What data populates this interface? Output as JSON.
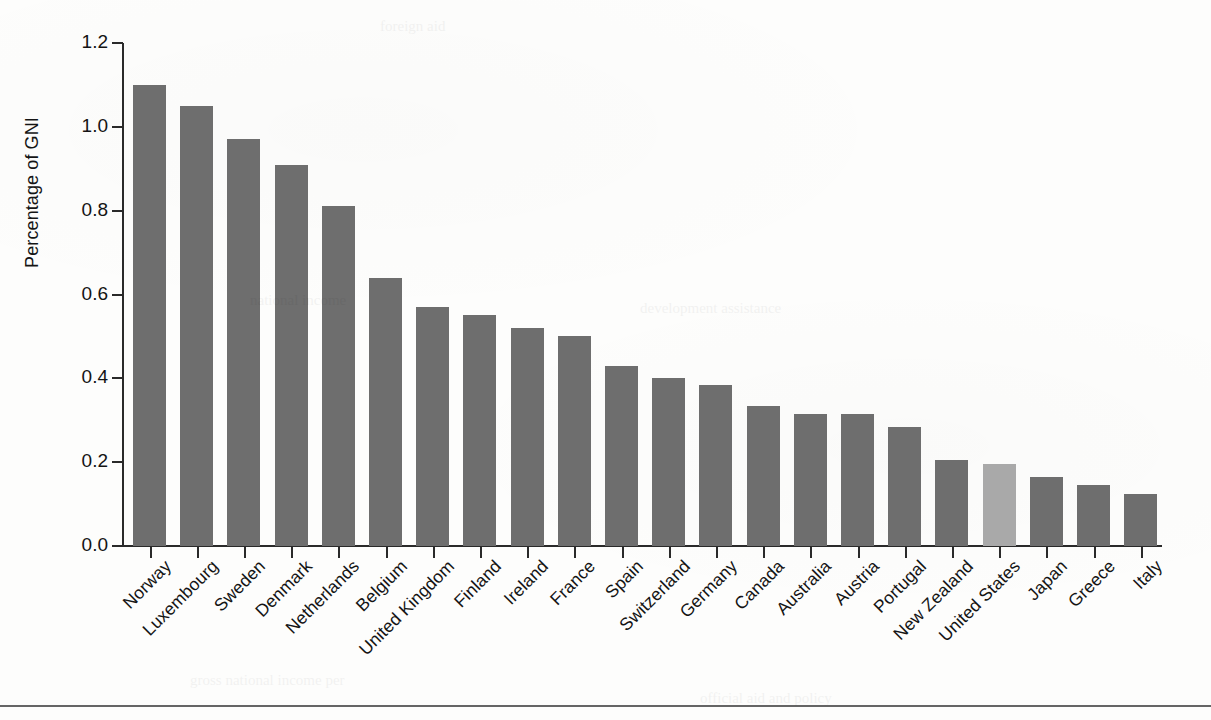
{
  "figure": {
    "background_color": "#fdfdfc",
    "bar_color": "#6e6e6e",
    "highlight_color": "#a9a9a9",
    "axis_color": "#2a2a2a",
    "highlight_country": "United States"
  },
  "chart_data": {
    "type": "bar",
    "title": "",
    "xlabel": "",
    "ylabel": "Percentage of GNI",
    "ylim": [
      0.0,
      1.2
    ],
    "yticks": [
      "0.0",
      "0.2",
      "0.4",
      "0.6",
      "0.8",
      "1.0",
      "1.2"
    ],
    "ytick_values": [
      0.0,
      0.2,
      0.4,
      0.6,
      0.8,
      1.0,
      1.2
    ],
    "grid": false,
    "legend": "none",
    "xtick_rotation": 45,
    "categories": [
      "Norway",
      "Luxembourg",
      "Sweden",
      "Denmark",
      "Netherlands",
      "Belgium",
      "United Kingdom",
      "Finland",
      "Ireland",
      "France",
      "Spain",
      "Switzerland",
      "Germany",
      "Canada",
      "Australia",
      "Austria",
      "Portugal",
      "New Zealand",
      "United States",
      "Japan",
      "Greece",
      "Italy"
    ],
    "values": [
      1.1,
      1.05,
      0.97,
      0.91,
      0.81,
      0.64,
      0.57,
      0.55,
      0.52,
      0.5,
      0.43,
      0.4,
      0.385,
      0.335,
      0.315,
      0.315,
      0.285,
      0.205,
      0.195,
      0.165,
      0.145,
      0.125
    ],
    "highlighted": [
      false,
      false,
      false,
      false,
      false,
      false,
      false,
      false,
      false,
      false,
      false,
      false,
      false,
      false,
      false,
      false,
      false,
      false,
      true,
      false,
      false,
      false
    ]
  }
}
